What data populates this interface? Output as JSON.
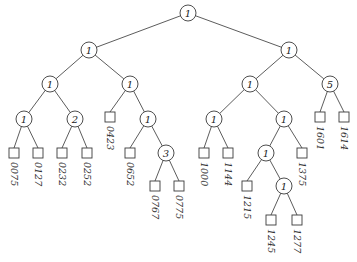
{
  "diagram": {
    "type": "binary-tree",
    "colors": {
      "stroke": "#3a3a3a",
      "text": "#222222",
      "background": "#ffffff"
    },
    "internal_nodes": [
      {
        "id": "n_root",
        "label": "1",
        "x": 188,
        "y": 13
      },
      {
        "id": "n_L",
        "label": "1",
        "x": 89,
        "y": 50
      },
      {
        "id": "n_R",
        "label": "1",
        "x": 289,
        "y": 50
      },
      {
        "id": "n_LL",
        "label": "1",
        "x": 50,
        "y": 84
      },
      {
        "id": "n_LR",
        "label": "1",
        "x": 130,
        "y": 84
      },
      {
        "id": "n_RL",
        "label": "1",
        "x": 250,
        "y": 84
      },
      {
        "id": "n_RR",
        "label": "5",
        "x": 330,
        "y": 84
      },
      {
        "id": "n_LLL",
        "label": "1",
        "x": 24,
        "y": 119
      },
      {
        "id": "n_LLR",
        "label": "2",
        "x": 75,
        "y": 119
      },
      {
        "id": "n_LRR",
        "label": "1",
        "x": 148,
        "y": 119
      },
      {
        "id": "n_RLL",
        "label": "1",
        "x": 214,
        "y": 119
      },
      {
        "id": "n_RLR",
        "label": "1",
        "x": 284,
        "y": 119
      },
      {
        "id": "n_LRRR",
        "label": "3",
        "x": 166,
        "y": 153
      },
      {
        "id": "n_RLRL",
        "label": "1",
        "x": 266,
        "y": 153
      },
      {
        "id": "n_RLRLR",
        "label": "1",
        "x": 284,
        "y": 186
      }
    ],
    "leaves": [
      {
        "id": "l_0075",
        "label": "0075",
        "x": 14,
        "y": 153
      },
      {
        "id": "l_0127",
        "label": "0127",
        "x": 38,
        "y": 153
      },
      {
        "id": "l_0232",
        "label": "0232",
        "x": 62,
        "y": 153
      },
      {
        "id": "l_0252",
        "label": "0252",
        "x": 87,
        "y": 153
      },
      {
        "id": "l_0423",
        "label": "0423",
        "x": 110,
        "y": 117
      },
      {
        "id": "l_0652",
        "label": "0652",
        "x": 130,
        "y": 153
      },
      {
        "id": "l_0767",
        "label": "0767",
        "x": 155,
        "y": 186
      },
      {
        "id": "l_0775",
        "label": "0775",
        "x": 179,
        "y": 186
      },
      {
        "id": "l_1000",
        "label": "1000",
        "x": 204,
        "y": 153
      },
      {
        "id": "l_1144",
        "label": "1144",
        "x": 228,
        "y": 153
      },
      {
        "id": "l_1215",
        "label": "1215",
        "x": 247,
        "y": 186
      },
      {
        "id": "l_1245",
        "label": "1245",
        "x": 271,
        "y": 220
      },
      {
        "id": "l_1277",
        "label": "1277",
        "x": 297,
        "y": 220
      },
      {
        "id": "l_1375",
        "label": "1375",
        "x": 302,
        "y": 153
      },
      {
        "id": "l_1601",
        "label": "1601",
        "x": 320,
        "y": 117
      },
      {
        "id": "l_1614",
        "label": "1614",
        "x": 344,
        "y": 117
      }
    ],
    "edges": [
      [
        "n_root",
        "n_L"
      ],
      [
        "n_root",
        "n_R"
      ],
      [
        "n_L",
        "n_LL"
      ],
      [
        "n_L",
        "n_LR"
      ],
      [
        "n_R",
        "n_RL"
      ],
      [
        "n_R",
        "n_RR"
      ],
      [
        "n_LL",
        "n_LLL"
      ],
      [
        "n_LL",
        "n_LLR"
      ],
      [
        "n_LR",
        "l_0423"
      ],
      [
        "n_LR",
        "n_LRR"
      ],
      [
        "n_RL",
        "n_RLL"
      ],
      [
        "n_RL",
        "n_RLR"
      ],
      [
        "n_RR",
        "l_1601"
      ],
      [
        "n_RR",
        "l_1614"
      ],
      [
        "n_LLL",
        "l_0075"
      ],
      [
        "n_LLL",
        "l_0127"
      ],
      [
        "n_LLR",
        "l_0232"
      ],
      [
        "n_LLR",
        "l_0252"
      ],
      [
        "n_LRR",
        "l_0652"
      ],
      [
        "n_LRR",
        "n_LRRR"
      ],
      [
        "n_LRRR",
        "l_0767"
      ],
      [
        "n_LRRR",
        "l_0775"
      ],
      [
        "n_RLL",
        "l_1000"
      ],
      [
        "n_RLL",
        "l_1144"
      ],
      [
        "n_RLR",
        "n_RLRL"
      ],
      [
        "n_RLR",
        "l_1375"
      ],
      [
        "n_RLRL",
        "l_1215"
      ],
      [
        "n_RLRL",
        "n_RLRLR"
      ],
      [
        "n_RLRLR",
        "l_1245"
      ],
      [
        "n_RLRLR",
        "l_1277"
      ]
    ]
  }
}
